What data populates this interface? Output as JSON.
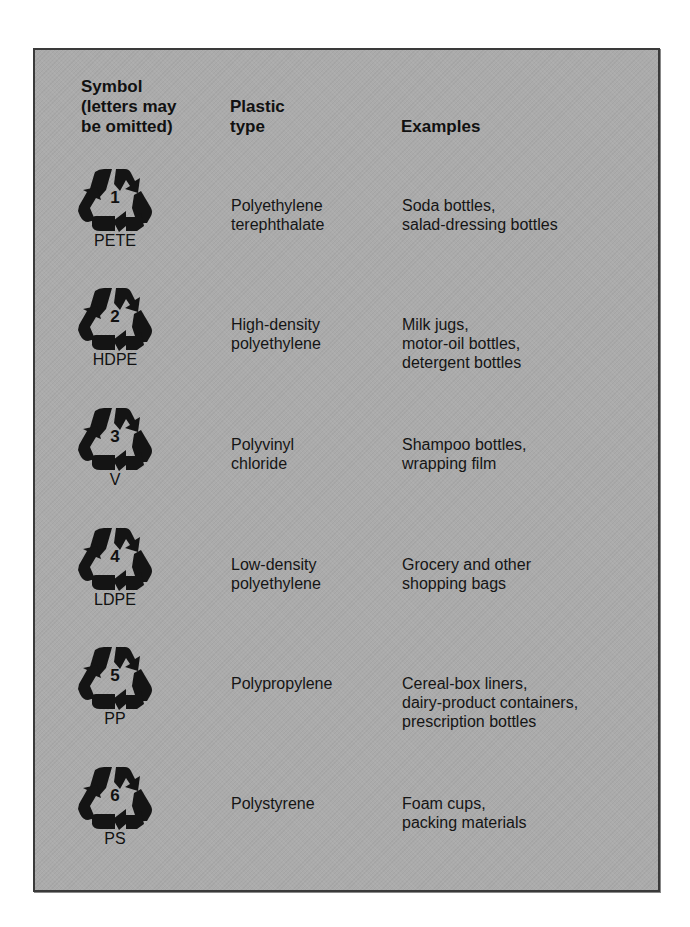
{
  "headers": {
    "symbol": [
      "Symbol",
      "(letters may",
      "be omitted)"
    ],
    "plastic_type": [
      "Plastic",
      "type"
    ],
    "examples": [
      "Examples"
    ]
  },
  "symbol_icon": "recycle-chasing-arrows-icon",
  "colors": {
    "panel_fill": "#ababab",
    "border": "#3a3a3a",
    "ink": "#111111"
  },
  "rows": [
    {
      "code": "1",
      "abbr": "PETE",
      "type": [
        "Polyethylene",
        "terephthalate"
      ],
      "examples": [
        "Soda bottles,",
        "salad-dressing bottles"
      ]
    },
    {
      "code": "2",
      "abbr": "HDPE",
      "type": [
        "High-density",
        "polyethylene"
      ],
      "examples": [
        "Milk jugs,",
        "motor-oil bottles,",
        "detergent bottles"
      ]
    },
    {
      "code": "3",
      "abbr": "V",
      "type": [
        "Polyvinyl",
        "chloride"
      ],
      "examples": [
        "Shampoo bottles,",
        "wrapping film"
      ]
    },
    {
      "code": "4",
      "abbr": "LDPE",
      "type": [
        "Low-density",
        "polyethylene"
      ],
      "examples": [
        "Grocery and other",
        "shopping bags"
      ]
    },
    {
      "code": "5",
      "abbr": "PP",
      "type": [
        "Polypropylene"
      ],
      "examples": [
        "Cereal-box liners,",
        "dairy-product containers,",
        "prescription bottles"
      ]
    },
    {
      "code": "6",
      "abbr": "PS",
      "type": [
        "Polystyrene"
      ],
      "examples": [
        "Foam cups,",
        "packing materials"
      ]
    }
  ]
}
